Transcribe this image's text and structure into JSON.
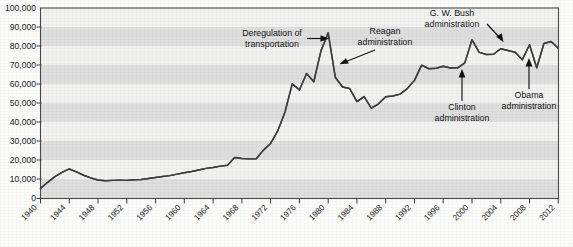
{
  "chart_data": {
    "type": "line",
    "title": "",
    "xlabel": "",
    "ylabel": "",
    "xlim": [
      1940,
      2012
    ],
    "ylim": [
      0,
      100000
    ],
    "grid": "horizontal-alternating-bands",
    "legend": "none",
    "y_ticks": [
      "0",
      "10,000",
      "20,000",
      "30,000",
      "40,000",
      "50,000",
      "60,000",
      "70,000",
      "80,000",
      "90,000",
      "100,000"
    ],
    "y_tick_values": [
      0,
      10000,
      20000,
      30000,
      40000,
      50000,
      60000,
      70000,
      80000,
      90000,
      100000
    ],
    "x_ticks": [
      "1940",
      "1944",
      "1948",
      "1952",
      "1956",
      "1960",
      "1964",
      "1968",
      "1972",
      "1976",
      "1980",
      "1984",
      "1988",
      "1992",
      "1996",
      "2000",
      "2004",
      "2008",
      "2012"
    ],
    "x_tick_values": [
      1940,
      1944,
      1948,
      1952,
      1956,
      1960,
      1964,
      1968,
      1972,
      1976,
      1980,
      1984,
      1988,
      1992,
      1996,
      2000,
      2004,
      2008,
      2012
    ],
    "series": [
      {
        "name": "Pages published",
        "color": "#3d3d3d",
        "x": [
          1940,
          1941,
          1942,
          1943,
          1944,
          1945,
          1946,
          1947,
          1948,
          1949,
          1950,
          1951,
          1952,
          1953,
          1954,
          1955,
          1956,
          1957,
          1958,
          1959,
          1960,
          1961,
          1962,
          1963,
          1964,
          1965,
          1966,
          1967,
          1968,
          1969,
          1970,
          1971,
          1972,
          1973,
          1974,
          1975,
          1976,
          1977,
          1978,
          1979,
          1980,
          1981,
          1982,
          1983,
          1984,
          1985,
          1986,
          1987,
          1988,
          1989,
          1990,
          1991,
          1992,
          1993,
          1994,
          1995,
          1996,
          1997,
          1998,
          1999,
          2000,
          2001,
          2002,
          2003,
          2004,
          2005,
          2006,
          2007,
          2008,
          2009,
          2010,
          2011,
          2012
        ],
        "values": [
          5300,
          8500,
          11500,
          13700,
          15500,
          14000,
          12200,
          10800,
          9700,
          9300,
          9500,
          9600,
          9500,
          9800,
          10000,
          10500,
          11000,
          11500,
          12000,
          12800,
          13500,
          14200,
          15000,
          15800,
          16300,
          17000,
          17500,
          21500,
          21000,
          20800,
          20900,
          25400,
          28900,
          35600,
          45400,
          60200,
          57000,
          65600,
          61300,
          77500,
          87000,
          63500,
          58500,
          57700,
          50900,
          53500,
          47400,
          49700,
          53400,
          53800,
          54800,
          57700,
          62000,
          70000,
          68100,
          68400,
          69400,
          68500,
          68600,
          71200,
          83300,
          76700,
          75600,
          75700,
          78600,
          77700,
          76800,
          72900,
          80700,
          68600,
          81400,
          82400,
          78900
        ]
      }
    ],
    "annotations": [
      {
        "id": "deregulation",
        "label_line1": "Deregulation of",
        "label_line2": "transportation",
        "target_year": 1979,
        "target_value": 82000
      },
      {
        "id": "reagan",
        "label_line1": "Reagan",
        "label_line2": "administration",
        "target_year": 1981,
        "target_value": 70000
      },
      {
        "id": "gw-bush",
        "label_line1": "G. W. Bush",
        "label_line2": "administration",
        "target_year": 2001,
        "target_value": 79000
      },
      {
        "id": "clinton",
        "label_line1": "Clinton",
        "label_line2": "administration",
        "target_year": 1997,
        "target_value": 69000
      },
      {
        "id": "obama",
        "label_line1": "Obama",
        "label_line2": "administration",
        "target_year": 2009,
        "target_value": 69500
      }
    ]
  }
}
